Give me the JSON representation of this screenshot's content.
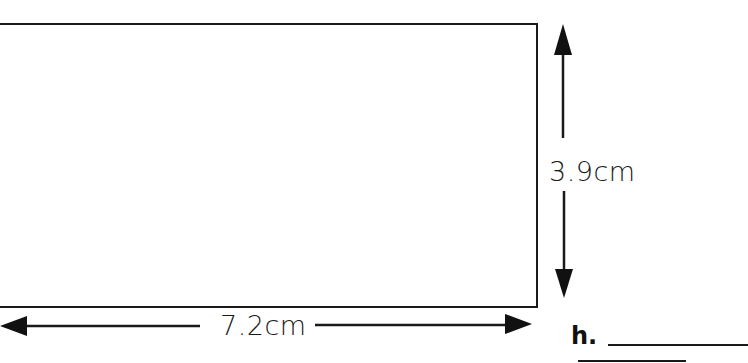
{
  "figure": {
    "shape": "rectangle",
    "width_label": "7.2cm",
    "height_label": "3.9cm",
    "width_value": 7.2,
    "height_value": 3.9,
    "unit": "cm"
  },
  "problem": {
    "id_label": "h.",
    "answer": ""
  },
  "colors": {
    "stroke": "#1a1a1a",
    "background": "#ffffff"
  }
}
